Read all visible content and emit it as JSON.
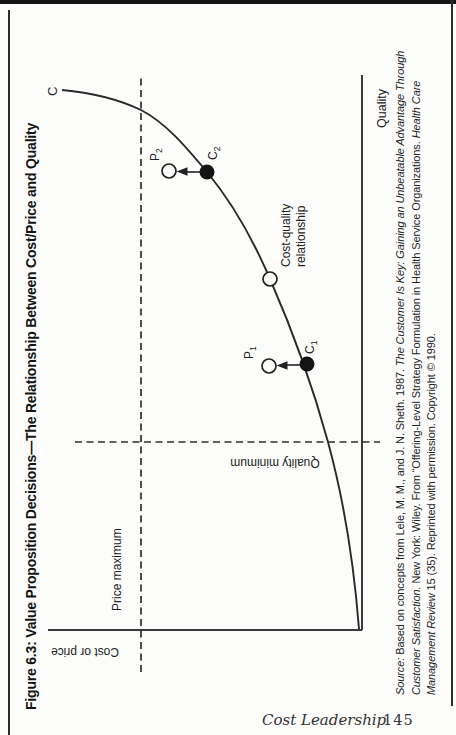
{
  "figure": {
    "title": "Figure 6.3: Value Proposition Decisions—The Relationship Between Cost/Price and Quality",
    "curve_label": "C",
    "axis_x_label": "Quality",
    "axis_y_label": "Cost or price",
    "price_max_label": "Price maximum",
    "quality_min_label": "Quality minimum",
    "cost_quality_label_line1": "Cost-quality",
    "cost_quality_label_line2": "relationship",
    "points": {
      "p2": {
        "base": "P",
        "sub": "2"
      },
      "c2": {
        "base": "C",
        "sub": "2"
      },
      "p1": {
        "base": "P",
        "sub": "1"
      },
      "c1": {
        "base": "C",
        "sub": "1"
      }
    },
    "source": {
      "line1_italic1": "Source:",
      "line1_roman1": " Based on concepts from Lele, M. M., and J. N. Sheth. 1987. ",
      "line1_italic2": "The Customer Is Key: Gaining an Unbeatable Advantage Through",
      "line2_italic1": "Customer Satisfaction.",
      "line2_roman1": " New York: Wiley. From “Offering-Level Strategy Formulation in Health Service Organizations. ",
      "line2_italic2": "Health Care",
      "line3_italic1": "Management Review",
      "line3_roman1": " 15 (35). Reprinted with permission. Copyright © 1990."
    }
  },
  "footer": {
    "running_title": "Cost Leadership",
    "page_number": "145"
  },
  "diagram": {
    "type": "conceptual-curve",
    "orientation": "landscape figure rotated 90° on portrait page",
    "curve": "C — convex cost curve rising from origin, cost increases steeply with quality",
    "thresholds": [
      {
        "label": "Price maximum",
        "style": "horizontal dashed line near top"
      },
      {
        "label": "Quality minimum",
        "style": "vertical dashed line left of center"
      }
    ],
    "points_on_curve": [
      "C1 (filled dot)",
      "C2 (filled dot)",
      "unlabeled open circle at cost-quality relationship"
    ],
    "points_above_curve": [
      "P1 (open circle above C1)",
      "P2 (open circle above C2)"
    ],
    "arrows": [
      "C1 → P1 upward",
      "C2 → P2 upward"
    ],
    "ink_color": "#222222",
    "paper_color": "#fcfcfa"
  }
}
